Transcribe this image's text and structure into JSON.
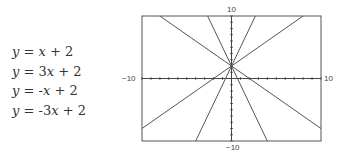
{
  "equations": [
    "y = x + 2",
    "y = 3x + 2",
    "y = -x + 2",
    "y = -3x + 2"
  ],
  "graph": {
    "xmin_label": "−10",
    "xmax_label": "10",
    "ymin_label": "−10",
    "ymax_label": "10"
  },
  "chart_data": {
    "type": "line",
    "series": [
      {
        "name": "y = x + 2",
        "slope": 1,
        "intercept": 2
      },
      {
        "name": "y = 3x + 2",
        "slope": 3,
        "intercept": 2
      },
      {
        "name": "y = -x + 2",
        "slope": -1,
        "intercept": 2
      },
      {
        "name": "y = -3x + 2",
        "slope": -3,
        "intercept": 2
      }
    ],
    "xlim": [
      -10,
      10
    ],
    "ylim": [
      -10,
      10
    ],
    "xlabel": "",
    "ylabel": "",
    "grid": false
  }
}
